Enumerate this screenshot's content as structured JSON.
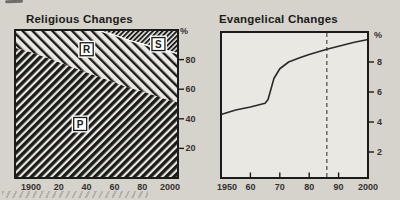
{
  "figure": {
    "background": "#d6d3cd",
    "ink": "#1b1b19",
    "paper": "#eae8e2"
  },
  "chart_data": [
    {
      "type": "area",
      "title": "Religious Changes",
      "y_axis_label": "%",
      "xlim": [
        1900,
        2000
      ],
      "ylim": [
        0,
        100
      ],
      "grid": false,
      "legend": "none",
      "categories": [
        1900,
        1910,
        1920,
        1930,
        1940,
        1950,
        1960,
        1970,
        1980,
        1990,
        2000
      ],
      "series": [
        {
          "name": "P",
          "hatch": "diagonal-thick",
          "values": [
            88,
            85,
            81,
            77,
            73,
            69,
            65,
            61,
            58,
            54,
            51
          ]
        },
        {
          "name": "R",
          "hatch": "diagonal-light-reverse",
          "values": [
            12,
            15,
            19,
            23,
            27,
            31,
            32,
            32,
            32,
            33,
            33
          ]
        },
        {
          "name": "S",
          "hatch": "diagonal-fine",
          "values": [
            0,
            0,
            0,
            0,
            0,
            0,
            3,
            7,
            10,
            13,
            16
          ]
        }
      ],
      "x_tick_labels": [
        "1900",
        "20",
        "40",
        "60",
        "80",
        "2000"
      ],
      "y_ticks": [
        20,
        40,
        60,
        80
      ],
      "region_labels": [
        {
          "text": "P",
          "year": 1940,
          "pct": 36.5
        },
        {
          "text": "R",
          "year": 1944,
          "pct": 87
        },
        {
          "text": "S",
          "year": 1988,
          "pct": 90.5
        }
      ]
    },
    {
      "type": "line",
      "title": "Evangelical Changes",
      "y_axis_label": "%",
      "xlim": [
        1950,
        2000
      ],
      "ylim": [
        0,
        10
      ],
      "grid": false,
      "x": [
        1950,
        1955,
        1960,
        1963,
        1965,
        1966,
        1967,
        1968,
        1970,
        1973,
        1977,
        1980,
        1986,
        1990,
        1995,
        2000
      ],
      "y": [
        4.5,
        4.8,
        5.0,
        5.15,
        5.25,
        5.5,
        6.2,
        6.9,
        7.55,
        8.0,
        8.3,
        8.5,
        8.85,
        9.05,
        9.3,
        9.5
      ],
      "x_tick_labels": [
        "1950",
        "60",
        "70",
        "80",
        "90",
        "2000"
      ],
      "x_tick_years": [
        1950,
        1960,
        1970,
        1980,
        1990,
        2000
      ],
      "x_inner_tick_years": [
        1960,
        1970,
        1980,
        1990
      ],
      "y_ticks": [
        2,
        4,
        6,
        8
      ],
      "dashed_vline_year": 1986
    }
  ]
}
